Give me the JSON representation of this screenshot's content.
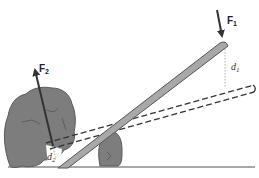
{
  "diagram": {
    "type": "lever",
    "labels": {
      "force_1": "F",
      "force_1_sub": "1",
      "force_2": "F",
      "force_2_sub": "2",
      "distance_1": "d",
      "distance_1_sub": "1",
      "distance_2": "d",
      "distance_2_sub": "2"
    },
    "colors": {
      "rock_fill": "#7d7d7d",
      "rock_stroke": "#5a5a5a",
      "lever_fill": "#a8a8a8",
      "lever_stroke": "#555555",
      "arrow": "#333333",
      "ground": "#888888",
      "dashed": "#333333"
    }
  }
}
